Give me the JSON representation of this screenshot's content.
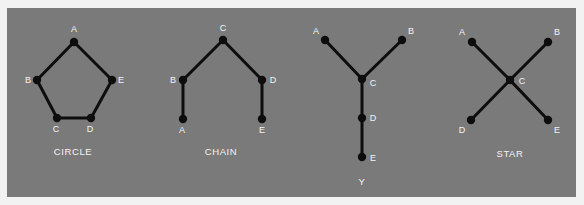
{
  "colors": {
    "background": "#f2f2f2",
    "panel": "#7a7a7a",
    "edge": "#0d0d0d",
    "label": "#f4f4f4"
  },
  "networks": [
    {
      "id": "circle",
      "caption": "CIRCLE",
      "caption_pos": [
        73,
        155
      ],
      "nodes": [
        {
          "id": "A",
          "x": 74,
          "y": 42,
          "lx": 74,
          "ly": 32,
          "anchor": "middle"
        },
        {
          "id": "B",
          "x": 37,
          "y": 80,
          "lx": 28,
          "ly": 83,
          "anchor": "middle"
        },
        {
          "id": "E",
          "x": 112,
          "y": 80,
          "lx": 121,
          "ly": 83,
          "anchor": "middle"
        },
        {
          "id": "C",
          "x": 57,
          "y": 118,
          "lx": 56,
          "ly": 132,
          "anchor": "middle"
        },
        {
          "id": "D",
          "x": 91,
          "y": 118,
          "lx": 90,
          "ly": 132,
          "anchor": "middle"
        }
      ],
      "edges": [
        [
          "A",
          "B"
        ],
        [
          "B",
          "C"
        ],
        [
          "C",
          "D"
        ],
        [
          "D",
          "E"
        ],
        [
          "E",
          "A"
        ]
      ]
    },
    {
      "id": "chain",
      "caption": "CHAIN",
      "caption_pos": [
        221,
        155
      ],
      "nodes": [
        {
          "id": "C",
          "x": 223,
          "y": 40,
          "lx": 223,
          "ly": 31,
          "anchor": "middle"
        },
        {
          "id": "B",
          "x": 183,
          "y": 80,
          "lx": 173,
          "ly": 83,
          "anchor": "middle"
        },
        {
          "id": "D",
          "x": 262,
          "y": 80,
          "lx": 273,
          "ly": 83,
          "anchor": "middle"
        },
        {
          "id": "A",
          "x": 183,
          "y": 119,
          "lx": 182,
          "ly": 133,
          "anchor": "middle"
        },
        {
          "id": "E",
          "x": 262,
          "y": 119,
          "lx": 262,
          "ly": 133,
          "anchor": "middle"
        }
      ],
      "edges": [
        [
          "A",
          "B"
        ],
        [
          "B",
          "C"
        ],
        [
          "C",
          "D"
        ],
        [
          "D",
          "E"
        ]
      ]
    },
    {
      "id": "y",
      "caption": "Y",
      "caption_pos": [
        362,
        185
      ],
      "nodes": [
        {
          "id": "A",
          "x": 325,
          "y": 40,
          "lx": 316,
          "ly": 34,
          "anchor": "middle"
        },
        {
          "id": "B",
          "x": 402,
          "y": 40,
          "lx": 411,
          "ly": 34,
          "anchor": "middle"
        },
        {
          "id": "C",
          "x": 362,
          "y": 79,
          "lx": 373,
          "ly": 86,
          "anchor": "middle"
        },
        {
          "id": "D",
          "x": 362,
          "y": 118,
          "lx": 373,
          "ly": 121,
          "anchor": "middle"
        },
        {
          "id": "E",
          "x": 362,
          "y": 157,
          "lx": 373,
          "ly": 161,
          "anchor": "middle"
        }
      ],
      "edges": [
        [
          "A",
          "C"
        ],
        [
          "B",
          "C"
        ],
        [
          "C",
          "D"
        ],
        [
          "D",
          "E"
        ]
      ]
    },
    {
      "id": "star",
      "caption": "STAR",
      "caption_pos": [
        510,
        157
      ],
      "nodes": [
        {
          "id": "A",
          "x": 472,
          "y": 42,
          "lx": 462,
          "ly": 35,
          "anchor": "middle"
        },
        {
          "id": "B",
          "x": 548,
          "y": 42,
          "lx": 557,
          "ly": 35,
          "anchor": "middle"
        },
        {
          "id": "C",
          "x": 510,
          "y": 80,
          "lx": 522,
          "ly": 84,
          "anchor": "middle"
        },
        {
          "id": "D",
          "x": 471,
          "y": 120,
          "lx": 462,
          "ly": 133,
          "anchor": "middle"
        },
        {
          "id": "E",
          "x": 548,
          "y": 120,
          "lx": 557,
          "ly": 133,
          "anchor": "middle"
        }
      ],
      "edges": [
        [
          "A",
          "C"
        ],
        [
          "B",
          "C"
        ],
        [
          "C",
          "D"
        ],
        [
          "C",
          "E"
        ]
      ]
    }
  ]
}
